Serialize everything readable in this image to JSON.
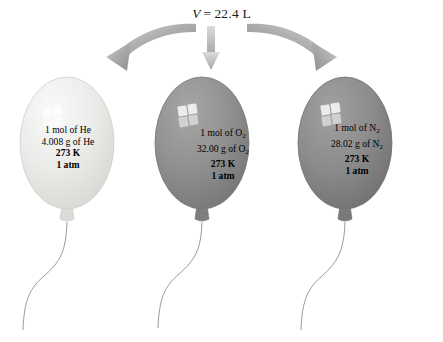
{
  "figure": {
    "name": "molar-volume-balloons-diagram",
    "background_color": "#ffffff",
    "title": {
      "variable": "V",
      "equals": "=",
      "value": "22.4 L",
      "full_text": "V = 22.4 L"
    },
    "arrows": [
      {
        "name": "arrow-to-helium-balloon",
        "shape": "curved-left",
        "color": "#9a9a9a",
        "points_to": "balloon-helium"
      },
      {
        "name": "arrow-to-oxygen-balloon",
        "shape": "straight-down",
        "color": "#b3b3b3",
        "points_to": "balloon-oxygen"
      },
      {
        "name": "arrow-to-nitrogen-balloon",
        "shape": "curved-right",
        "color": "#9a9a9a",
        "points_to": "balloon-nitrogen"
      }
    ],
    "balloons": [
      {
        "id": "helium",
        "label": "balloon-helium",
        "fill_color": "#e6e6e4",
        "edge_color": "#cfcfcc",
        "highlight": "window-reflection",
        "lines": [
          {
            "text": "1 mol of He",
            "bold": false
          },
          {
            "text": "4.008 g of He",
            "bold": false
          },
          {
            "text": "273 K",
            "bold": true
          },
          {
            "text": "1 atm",
            "bold": true
          }
        ],
        "substance": "He",
        "moles": "1 mol",
        "mass": "4.008 g",
        "temperature": "273 K",
        "pressure": "1 atm"
      },
      {
        "id": "oxygen",
        "label": "balloon-oxygen",
        "fill_color": "#8f8f8f",
        "edge_color": "#787878",
        "highlight": "window-reflection",
        "lines": [
          {
            "text": "1 mol of O",
            "sub": "2",
            "bold": false
          },
          {
            "text": "32.00 g of O",
            "sub": "2",
            "bold": false
          },
          {
            "text": "273 K",
            "bold": true
          },
          {
            "text": "1 atm",
            "bold": true
          }
        ],
        "substance": "O2",
        "moles": "1 mol",
        "mass": "32.00 g",
        "temperature": "273 K",
        "pressure": "1 atm"
      },
      {
        "id": "nitrogen",
        "label": "balloon-nitrogen",
        "fill_color": "#8a8a8a",
        "edge_color": "#737373",
        "highlight": "window-reflection",
        "lines": [
          {
            "text": "1 mol of N",
            "sub": "2",
            "bold": false
          },
          {
            "text": "28.02 g of N",
            "sub": "2",
            "bold": false
          },
          {
            "text": "273 K",
            "bold": true
          },
          {
            "text": "1 atm",
            "bold": true
          }
        ],
        "substance": "N2",
        "moles": "1 mol",
        "mass": "28.02 g",
        "temperature": "273 K",
        "pressure": "1 atm"
      }
    ],
    "strings": {
      "name": "balloon-strings",
      "color": "#8c8c8c",
      "count": 3,
      "shape": "s-curve"
    }
  }
}
